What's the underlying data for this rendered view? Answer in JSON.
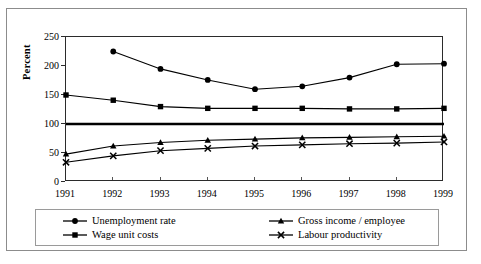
{
  "figure": {
    "clipped_caption_hint": "",
    "border_color": "#8c8c8c",
    "plot_line_color": "#000000"
  },
  "axes": {
    "ylabel": "Percent",
    "yticks": [
      "0",
      "50",
      "100",
      "150",
      "200",
      "250"
    ],
    "xticks": [
      "1991",
      "1992",
      "1993",
      "1994",
      "1995",
      "1996",
      "1997",
      "1998",
      "1999"
    ]
  },
  "legend": {
    "items": [
      {
        "label": "Unemployment rate",
        "marker": "circle-marker"
      },
      {
        "label": "Gross income / employee",
        "marker": "triangle-marker"
      },
      {
        "label": "Wage unit costs",
        "marker": "square-marker"
      },
      {
        "label": "Labour productivity",
        "marker": "cross-marker"
      }
    ]
  },
  "chart_data": {
    "type": "line",
    "title": "",
    "xlabel": "",
    "ylabel": "Percent",
    "x": [
      1991,
      1992,
      1993,
      1994,
      1995,
      1996,
      1997,
      1998,
      1999
    ],
    "xlim": [
      1991,
      1999
    ],
    "ylim": [
      0,
      250
    ],
    "yticks": [
      0,
      50,
      100,
      150,
      200,
      250
    ],
    "grid": false,
    "legend_position": "bottom",
    "reference_line": {
      "value": 100,
      "style": "bold-solid"
    },
    "series": [
      {
        "name": "Unemployment rate",
        "marker": "circle",
        "x": [
          1992,
          1993,
          1994,
          1995,
          1996,
          1997,
          1998,
          1999
        ],
        "values": [
          225,
          195,
          176,
          160,
          165,
          180,
          203,
          204
        ]
      },
      {
        "name": "Wage unit costs",
        "marker": "square",
        "x": [
          1991,
          1992,
          1993,
          1994,
          1995,
          1996,
          1997,
          1998,
          1999
        ],
        "values": [
          150,
          141,
          130,
          127,
          127,
          127,
          126,
          126,
          127
        ]
      },
      {
        "name": "Gross income / employee",
        "marker": "triangle",
        "x": [
          1991,
          1992,
          1993,
          1994,
          1995,
          1996,
          1997,
          1998,
          1999
        ],
        "values": [
          48,
          62,
          68,
          72,
          74,
          76,
          77,
          78,
          79
        ]
      },
      {
        "name": "Labour productivity",
        "marker": "cross",
        "x": [
          1991,
          1992,
          1993,
          1994,
          1995,
          1996,
          1997,
          1998,
          1999
        ],
        "values": [
          34,
          45,
          54,
          58,
          62,
          64,
          66,
          67,
          69
        ]
      }
    ]
  }
}
